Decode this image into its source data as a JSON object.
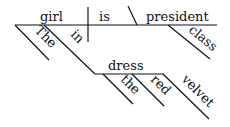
{
  "diagram": {
    "type": "sentence-diagram",
    "sentence": "The girl in the red velvet dress is class president",
    "subject": "girl",
    "verb": "is",
    "predicate_noun": "president",
    "modifiers": {
      "the_article": "The",
      "preposition": "in",
      "prep_object": "dress",
      "dress_mod_1": "the",
      "dress_mod_2": "red",
      "dress_mod_3": "velvet",
      "president_mod": "class"
    },
    "colors": {
      "ink": "#111111",
      "background": "#ffffff"
    }
  }
}
